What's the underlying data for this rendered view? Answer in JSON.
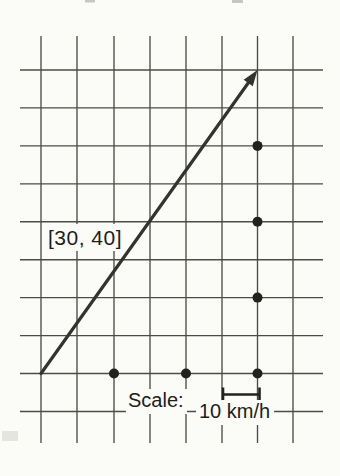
{
  "figure": {
    "background": "#fbfbf8",
    "grid_color": "#4c4c46",
    "ink_color": "#33332f",
    "dot_color": "#21211e",
    "text_color": "#1d1d1b"
  },
  "labels": {
    "vector_label": "[30, 40]",
    "scale_label": "Scale:",
    "scale_value": "10 km/h"
  },
  "diagram": {
    "grid": {
      "vertical_lines_x": [
        41,
        77,
        114,
        150,
        186,
        222,
        257.5,
        293
      ],
      "vertical_line_top": 36,
      "vertical_line_bottom": 443,
      "horizontal_lines_y": [
        70,
        107.9,
        145.9,
        183.8,
        221.7,
        259.7,
        297.6,
        335.6,
        373.5,
        411.5
      ],
      "horizontal_line_left": 20,
      "horizontal_line_right": 323,
      "line_width": 1.35
    },
    "vector": {
      "x1": 41,
      "y1": 373.5,
      "x2": 257.5,
      "y2": 70,
      "stroke_width": 3.2,
      "head_length": 16,
      "head_half_width": 5.6
    },
    "dots": {
      "radius": 5,
      "points": [
        [
          114,
          373.5
        ],
        [
          186,
          373.5
        ],
        [
          257.5,
          373.5
        ],
        [
          257.5,
          297.6
        ],
        [
          257.5,
          221.7
        ],
        [
          257.5,
          145.9
        ]
      ]
    },
    "scale_bracket": {
      "x1": 223,
      "x2": 259.5,
      "y": 394.5,
      "tick_top": 387.5,
      "tick_bottom": 401.5,
      "stroke_width": 2.6
    },
    "artifacts": [
      {
        "x": 85,
        "y": 0,
        "w": 10,
        "h": 2.5,
        "color": "#9a9a96",
        "opacity": 0.55
      },
      {
        "x": 232,
        "y": 0,
        "w": 11,
        "h": 3,
        "color": "#9a9a96",
        "opacity": 0.55
      },
      {
        "x": 2,
        "y": 431,
        "w": 16,
        "h": 10,
        "color": "#cacac4",
        "opacity": 0.45
      }
    ]
  }
}
